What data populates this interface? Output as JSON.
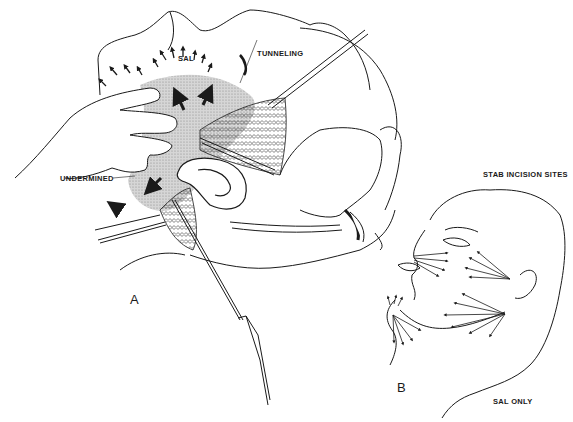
{
  "figure": {
    "panel_a": {
      "letter": "A",
      "labels": {
        "sal": "SAL",
        "tunneling": "TUNNELING",
        "undermined": "UNDERMINED"
      }
    },
    "panel_b": {
      "letter": "B",
      "labels": {
        "stab_incision_sites": "STAB INCISION SITES",
        "sal_only": "SAL ONLY"
      }
    },
    "colors": {
      "ink": "#1a1a1a",
      "shading": "#c8c8c8",
      "background": "#ffffff"
    }
  }
}
